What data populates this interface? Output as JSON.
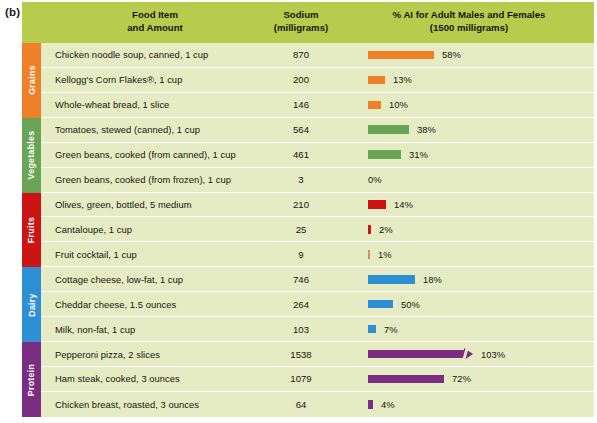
{
  "figure_label": "(b)",
  "header": {
    "food_col_line1": "Food Item",
    "food_col_line2": "and Amount",
    "sodium_col_line1": "Sodium",
    "sodium_col_line2": "(milligrams)",
    "percent_col_line1": "% AI for Adult Males and Females",
    "percent_col_line2": "(1500 milligrams)"
  },
  "categories": [
    {
      "label": "Grains",
      "color": "#ef7f28",
      "rows": 3
    },
    {
      "label": "Vegetables",
      "color": "#6aa557",
      "rows": 3
    },
    {
      "label": "Fruits",
      "color": "#cc1417",
      "rows": 3
    },
    {
      "label": "Dairy",
      "color": "#2e8fd4",
      "rows": 3
    },
    {
      "label": "Protein",
      "color": "#7b2d82",
      "rows": 3
    }
  ],
  "rows": [
    {
      "food": "Chicken noodle soup, canned, 1 cup",
      "sodium": "870",
      "percent": "58%",
      "bar_px": 66,
      "color": "#ef7f28",
      "jagged": false
    },
    {
      "food": "Kellogg's Corn Flakes®, 1 cup",
      "sodium": "200",
      "percent": "13%",
      "bar_px": 17,
      "color": "#ef7f28",
      "jagged": false
    },
    {
      "food": "Whole-wheat bread, 1 slice",
      "sodium": "146",
      "percent": "10%",
      "bar_px": 13,
      "color": "#ef7f28",
      "jagged": false
    },
    {
      "food": "Tomatoes, stewed (canned), 1 cup",
      "sodium": "564",
      "percent": "38%",
      "bar_px": 41,
      "color": "#6aa557",
      "jagged": false
    },
    {
      "food": "Green beans, cooked (from canned), 1 cup",
      "sodium": "461",
      "percent": "31%",
      "bar_px": 33,
      "color": "#6aa557",
      "jagged": false
    },
    {
      "food": "Green beans, cooked (from frozen), 1 cup",
      "sodium": "3",
      "percent": "0%",
      "bar_px": 0,
      "color": "#6aa557",
      "jagged": false
    },
    {
      "food": "Olives, green, bottled, 5 medium",
      "sodium": "210",
      "percent": "14%",
      "bar_px": 18,
      "color": "#cc1417",
      "jagged": false
    },
    {
      "food": "Cantaloupe, 1 cup",
      "sodium": "25",
      "percent": "2%",
      "bar_px": 3,
      "color": "#cc1417",
      "jagged": false
    },
    {
      "food": "Fruit cocktail, 1 cup",
      "sodium": "9",
      "percent": "1%",
      "bar_px": 2,
      "color": "#d98a6a",
      "jagged": false
    },
    {
      "food": "Cottage cheese, low-fat, 1 cup",
      "sodium": "746",
      "percent": "18%",
      "bar_px": 47,
      "color": "#2e8fd4",
      "jagged": false
    },
    {
      "food": "Cheddar cheese, 1.5 ounces",
      "sodium": "264",
      "percent": "50%",
      "bar_px": 25,
      "color": "#2e8fd4",
      "jagged": false
    },
    {
      "food": "Milk, non-fat, 1 cup",
      "sodium": "103",
      "percent": "7%",
      "bar_px": 8,
      "color": "#2e8fd4",
      "jagged": false
    },
    {
      "food": "Pepperoni pizza, 2 slices",
      "sodium": "1538",
      "percent": "103%",
      "bar_px": 96,
      "color": "#7b2d82",
      "jagged": true
    },
    {
      "food": "Ham steak, cooked, 3 ounces",
      "sodium": "1079",
      "percent": "72%",
      "bar_px": 76,
      "color": "#7b2d82",
      "jagged": false
    },
    {
      "food": "Chicken breast, roasted, 3 ounces",
      "sodium": "64",
      "percent": "4%",
      "bar_px": 5,
      "color": "#7b2d82",
      "jagged": false
    }
  ],
  "chart_data": {
    "type": "bar",
    "title": "% AI for Adult Males and Females (1500 milligrams)",
    "xlabel": "% AI for Adult Males and Females",
    "ylabel": "Food Item and Amount",
    "categories": [
      "Chicken noodle soup, canned, 1 cup",
      "Kellogg's Corn Flakes®, 1 cup",
      "Whole-wheat bread, 1 slice",
      "Tomatoes, stewed (canned), 1 cup",
      "Green beans, cooked (from canned), 1 cup",
      "Green beans, cooked (from frozen), 1 cup",
      "Olives, green, bottled, 5 medium",
      "Cantaloupe, 1 cup",
      "Fruit cocktail, 1 cup",
      "Cottage cheese, low-fat, 1 cup",
      "Cheddar cheese, 1.5 ounces",
      "Milk, non-fat, 1 cup",
      "Pepperoni pizza, 2 slices",
      "Ham steak, cooked, 3 ounces",
      "Chicken breast, roasted, 3 ounces"
    ],
    "series": [
      {
        "name": "Sodium (milligrams)",
        "values": [
          870,
          200,
          146,
          564,
          461,
          3,
          210,
          25,
          9,
          746,
          264,
          103,
          1538,
          1079,
          64
        ]
      },
      {
        "name": "% AI (1500 milligrams)",
        "values": [
          58,
          13,
          10,
          38,
          31,
          0,
          14,
          2,
          1,
          18,
          50,
          7,
          103,
          72,
          4
        ]
      }
    ],
    "group_labels": [
      "Grains",
      "Vegetables",
      "Fruits",
      "Dairy",
      "Protein"
    ],
    "grid": false,
    "legend": "none"
  }
}
